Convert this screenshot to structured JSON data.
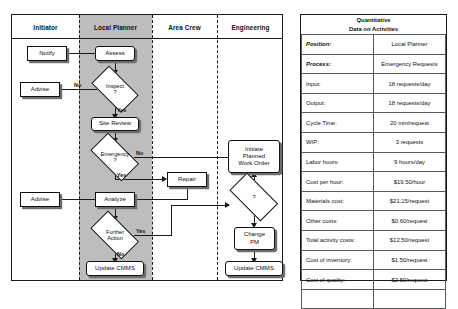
{
  "flowchart": {
    "lanes": [
      {
        "id": "initiator",
        "label": "Initiator"
      },
      {
        "id": "local-planner",
        "label": "Local Planner"
      },
      {
        "id": "area-crew",
        "label": "Area Crew"
      },
      {
        "id": "engineering",
        "label": "Engineering"
      }
    ],
    "nodes": {
      "notify": "Notify",
      "assess": "Assess",
      "inspect": "Inspect\n?",
      "inspect_l1": "Inspect",
      "inspect_l2": "?",
      "advise_top": "Advise",
      "site_review": "Site Review",
      "emergency_l1": "Emergency",
      "emergency_l2": "?",
      "repair": "Repair",
      "analyze": "Analyze",
      "advise_mid": "Advise",
      "further_l1": "Further",
      "further_l2": "Action",
      "update_cmms_planner": "Update CMMS",
      "initiate_l1": "Initiate",
      "initiate_l2": "Planned",
      "initiate_l3": "Work Order",
      "eng_decision": "?",
      "change_pm_l1": "Change",
      "change_pm_l2": "PM",
      "update_cmms_eng": "Update CMMS"
    },
    "edge_labels": {
      "inspect_no": "No",
      "inspect_yes": "Yes",
      "emergency_no": "No",
      "emergency_yes": "Yes",
      "further_yes": "Yes",
      "further_no": "No"
    }
  },
  "table": {
    "title_line1": "Quantitative",
    "title_line2": "Data on Activities",
    "meta": [
      {
        "key": "Position:",
        "value": "Local Planner"
      },
      {
        "key": "Process:",
        "value": "Emergency Requests"
      }
    ],
    "rows": [
      {
        "key": "Input:",
        "value": "18 requests/day"
      },
      {
        "key": "Output:",
        "value": "18 requests/day"
      },
      {
        "key": "Cycle Time:",
        "value": "20 min/request"
      },
      {
        "key": "WIP:",
        "value": "3 requests"
      },
      {
        "key": "Labor hours:",
        "value": "9 hours/day"
      },
      {
        "key": "Cost per hour:",
        "value": "$19.50/hour"
      },
      {
        "key": "Materials cost:",
        "value": "$21.15/request"
      },
      {
        "key": "Other costs:",
        "value": "$0.60/request"
      },
      {
        "key": "Total activity costs:",
        "value": "$12.50/request"
      },
      {
        "key": "Cost of inventory:",
        "value": "$1.50/request"
      },
      {
        "key": "Cost of quality:",
        "value": "$2.50/request"
      }
    ]
  },
  "colors": {
    "lane_shade": "#bdbdbd",
    "line": "#1a1a1a",
    "node_fill": "#ffffff",
    "shadow": "#6e6e6e"
  }
}
